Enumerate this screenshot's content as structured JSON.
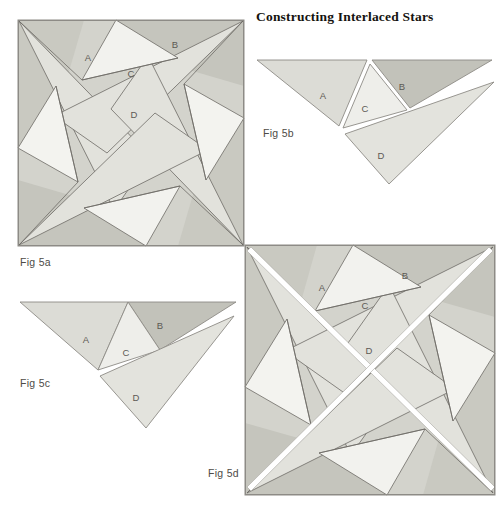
{
  "page": {
    "title": "Constructing Interlaced Stars",
    "background": "#ffffff"
  },
  "palette": {
    "ink": "#5a5853",
    "frame": "#8d8b86",
    "light": "#f2f2ee",
    "pale": "#e9e9e4",
    "mid": "#dcdcd6",
    "base": "#d3d3cc",
    "dark": "#c2c2ba",
    "darker": "#b6b6ad",
    "label": "#5c5954",
    "caption": "#4e4b47"
  },
  "figures": [
    {
      "id": "fig-5a",
      "caption": "Fig 5a",
      "kind": "interlaced-star-square",
      "note": "Four-fold pinwheel star inside a square frame; pieces A, B, C, D labelled in the upper-left quadrant.",
      "size": [
        226,
        226
      ],
      "piece_labels": [
        {
          "name": "A",
          "x": 70,
          "y": 38
        },
        {
          "name": "B",
          "x": 157,
          "y": 25
        },
        {
          "name": "C",
          "x": 113,
          "y": 54
        },
        {
          "name": "D",
          "x": 116,
          "y": 95
        }
      ]
    },
    {
      "id": "fig-5b",
      "caption": "Fig 5b",
      "kind": "exploded-pieces-separated",
      "note": "The four pieces A, B, C, D shown pulled apart with white gaps between them.",
      "size": [
        232,
        130
      ],
      "piece_labels": [
        {
          "name": "A",
          "x": 68,
          "y": 38
        },
        {
          "name": "B",
          "x": 145,
          "y": 29
        },
        {
          "name": "C",
          "x": 108,
          "y": 51
        },
        {
          "name": "D",
          "x": 123,
          "y": 97
        }
      ]
    },
    {
      "id": "fig-5c",
      "caption": "Fig 5c",
      "kind": "exploded-pieces-joined",
      "note": "The same four pieces with A, B and C touching and D displaced below-right.",
      "size": [
        216,
        130
      ],
      "piece_labels": [
        {
          "name": "A",
          "x": 68,
          "y": 40
        },
        {
          "name": "B",
          "x": 140,
          "y": 26
        },
        {
          "name": "C",
          "x": 107,
          "y": 53
        },
        {
          "name": "D",
          "x": 114,
          "y": 95
        }
      ]
    },
    {
      "id": "fig-5d",
      "caption": "Fig 5d",
      "kind": "interlaced-star-square-with-breaks",
      "note": "Same square star as Fig 5a but with white interlacing breaks along the two long diagonals.",
      "size": [
        250,
        250
      ],
      "piece_labels": [
        {
          "name": "A",
          "x": 77,
          "y": 43
        },
        {
          "name": "B",
          "x": 158,
          "y": 31
        },
        {
          "name": "C",
          "x": 118,
          "y": 61
        },
        {
          "name": "D",
          "x": 122,
          "y": 105
        }
      ]
    }
  ]
}
